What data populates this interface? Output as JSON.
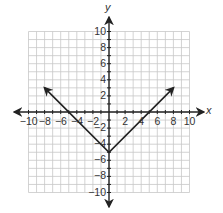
{
  "chart_data": {
    "type": "line",
    "title": "",
    "xlabel": "x",
    "ylabel": "y",
    "xlim": [
      -10,
      10
    ],
    "ylim": [
      -10,
      10
    ],
    "grid": true,
    "grid_step": 1,
    "x_ticks": [
      "−10",
      "−8",
      "−6",
      "−4",
      "−2",
      "2",
      "4",
      "6",
      "8",
      "10"
    ],
    "y_ticks": [
      "10",
      "8",
      "6",
      "4",
      "2",
      "−2",
      "−4",
      "−6",
      "−8",
      "−10"
    ],
    "x_tick_values": [
      -10,
      -8,
      -6,
      -4,
      -2,
      2,
      4,
      6,
      8,
      10
    ],
    "y_tick_values": [
      10,
      8,
      6,
      4,
      2,
      -2,
      -4,
      -6,
      -8,
      -10
    ],
    "series": [
      {
        "name": "y = |x| − 5",
        "points": [
          [
            -8,
            3
          ],
          [
            0,
            -5
          ],
          [
            8,
            3
          ]
        ],
        "arrows": "both ends",
        "color": "#222222"
      }
    ],
    "key_points": {
      "vertex": [
        0,
        -5
      ],
      "x_intercepts": [
        [
          -5,
          0
        ],
        [
          5,
          0
        ]
      ],
      "y_intercept": [
        0,
        -5
      ]
    }
  },
  "colors": {
    "grid": "#c8c8c8",
    "axis": "#222222",
    "line": "#222222",
    "text": "#333333"
  }
}
